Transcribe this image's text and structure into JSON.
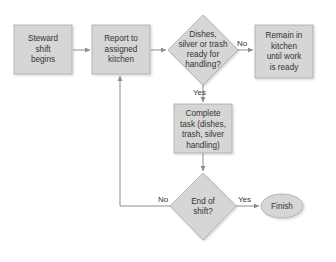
{
  "diagram": {
    "type": "flowchart",
    "colors": {
      "shape_fill": "#d6d6d6",
      "shape_stroke": "#a8a8a8",
      "line": "#8c8c8c",
      "text": "#333333",
      "background": "#ffffff"
    },
    "nodes": [
      {
        "id": "start",
        "shape": "rect",
        "lines": [
          "Steward",
          "shift",
          "begins"
        ]
      },
      {
        "id": "report",
        "shape": "rect",
        "lines": [
          "Report to",
          "assigned",
          "kitchen"
        ]
      },
      {
        "id": "ready",
        "shape": "diamond",
        "lines": [
          "Dishes,",
          "silver or trash",
          "ready for",
          "handling?"
        ]
      },
      {
        "id": "remain",
        "shape": "rect",
        "lines": [
          "Remain in",
          "kitchen",
          "until work",
          "is ready"
        ]
      },
      {
        "id": "complete",
        "shape": "rect",
        "lines": [
          "Complete",
          "task (dishes,",
          "trash, silver",
          "handling)"
        ]
      },
      {
        "id": "endshift",
        "shape": "diamond",
        "lines": [
          "End of",
          "shift?"
        ]
      },
      {
        "id": "finish",
        "shape": "ellipse",
        "lines": [
          "Finish"
        ]
      }
    ],
    "edges": [
      {
        "from": "start",
        "to": "report",
        "label": ""
      },
      {
        "from": "report",
        "to": "ready",
        "label": ""
      },
      {
        "from": "ready",
        "to": "remain",
        "label": "No"
      },
      {
        "from": "ready",
        "to": "complete",
        "label": "Yes"
      },
      {
        "from": "complete",
        "to": "endshift",
        "label": ""
      },
      {
        "from": "endshift",
        "to": "finish",
        "label": "Yes"
      },
      {
        "from": "endshift",
        "to": "report",
        "label": "No"
      }
    ]
  }
}
